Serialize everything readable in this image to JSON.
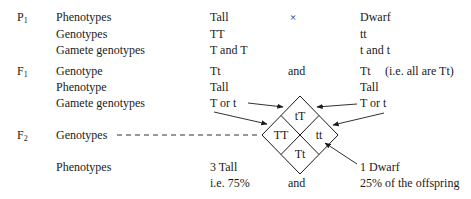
{
  "generations": {
    "p1": {
      "letter": "P",
      "sub": "1"
    },
    "f1": {
      "letter": "F",
      "sub": "1"
    },
    "f2": {
      "letter": "F",
      "sub": "2"
    }
  },
  "p1": {
    "phenotypes_label": "Phenotypes",
    "genotypes_label": "Genotypes",
    "gametes_label": "Gamete genotypes",
    "parent1": {
      "phenotype": "Tall",
      "genotype": "TT",
      "gametes": "T and T"
    },
    "cross_symbol": "×",
    "parent2": {
      "phenotype": "Dwarf",
      "genotype": "tt",
      "gametes": "t and t"
    }
  },
  "f1": {
    "genotype_label": "Genotype",
    "phenotype_label": "Phenotype",
    "gametes_label": "Gamete genotypes",
    "left": {
      "genotype": "Tt",
      "phenotype": "Tall",
      "gametes": "T or t"
    },
    "and": "and",
    "right": {
      "genotype": "Tt",
      "note": "(i.e. all are Tt)",
      "phenotype": "Tall",
      "gametes": "T or t"
    }
  },
  "f2": {
    "genotypes_label": "Genotypes",
    "phenotypes_label": "Phenotypes",
    "punnett": {
      "top": "tT",
      "left": "TT",
      "right": "tt",
      "bottom": "Tt"
    },
    "tall": {
      "count": "3 Tall",
      "percent": "i.e. 75%"
    },
    "and": "and",
    "dwarf": {
      "count": "1 Dwarf",
      "percent": "25% of the offspring"
    }
  }
}
